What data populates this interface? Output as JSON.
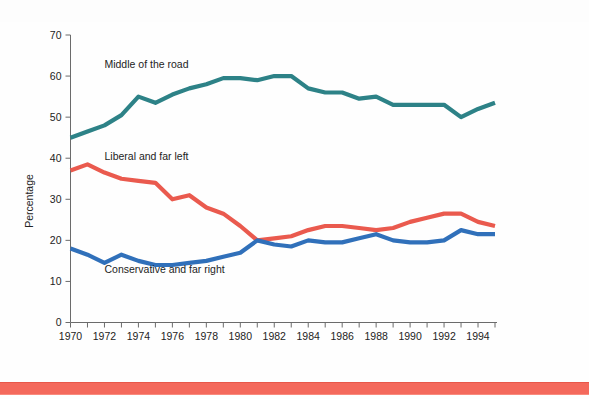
{
  "figure": {
    "background_color": "#fefefe",
    "footer_rule_color": "#f4695c"
  },
  "chart_data": {
    "type": "line",
    "title": "",
    "subtitle": "",
    "xlabel": "",
    "ylabel": "Percentage",
    "xlim": [
      1970,
      1995
    ],
    "ylim": [
      0,
      70
    ],
    "yticks": [
      0,
      10,
      20,
      30,
      40,
      50,
      60,
      70
    ],
    "ytick_labels": [
      "0",
      "10",
      "20",
      "30",
      "40",
      "50",
      "60",
      "70"
    ],
    "xticks": [
      1970,
      1971,
      1972,
      1973,
      1974,
      1975,
      1976,
      1977,
      1978,
      1979,
      1980,
      1981,
      1982,
      1983,
      1984,
      1985,
      1986,
      1987,
      1988,
      1989,
      1990,
      1991,
      1992,
      1993,
      1994,
      1995
    ],
    "xtick_labels_shown": [
      "1970",
      "1972",
      "1974",
      "1976",
      "1978",
      "1980",
      "1982",
      "1984",
      "1986",
      "1988",
      "1990",
      "1992",
      "1994"
    ],
    "grid": false,
    "legend_position": "inline-annotations",
    "x": [
      1970,
      1971,
      1972,
      1973,
      1974,
      1975,
      1976,
      1977,
      1978,
      1979,
      1980,
      1981,
      1982,
      1983,
      1984,
      1985,
      1986,
      1987,
      1988,
      1989,
      1990,
      1991,
      1992,
      1993,
      1994,
      1995
    ],
    "series": [
      {
        "name": "Middle of the road",
        "color": "#2d8287",
        "label_text": "Middle of the road",
        "values": [
          45.0,
          46.5,
          48.0,
          50.5,
          55.0,
          53.5,
          55.5,
          57.0,
          58.0,
          59.5,
          59.5,
          59.0,
          60.0,
          60.0,
          57.0,
          56.0,
          56.0,
          54.5,
          55.0,
          53.0,
          53.0,
          53.0,
          53.0,
          50.0,
          52.0,
          53.5
        ]
      },
      {
        "name": "Liberal and far left",
        "color": "#ea5a4e",
        "label_text": "Liberal and far left",
        "values": [
          37.0,
          38.5,
          36.5,
          35.0,
          34.5,
          34.0,
          30.0,
          31.0,
          28.0,
          26.5,
          23.5,
          20.0,
          20.5,
          21.0,
          22.5,
          23.5,
          23.5,
          23.0,
          22.5,
          23.0,
          24.5,
          25.5,
          26.5,
          26.5,
          24.5,
          23.5
        ]
      },
      {
        "name": "Conservative and far right",
        "color": "#3070ba",
        "label_text": "Conservative and far right",
        "values": [
          18.0,
          16.5,
          14.5,
          16.5,
          15.0,
          14.0,
          14.0,
          14.5,
          15.0,
          16.0,
          17.0,
          20.0,
          19.0,
          18.5,
          20.0,
          19.5,
          19.5,
          20.5,
          21.5,
          20.0,
          19.5,
          19.5,
          20.0,
          22.5,
          21.5,
          21.5
        ]
      }
    ],
    "annotations": [
      {
        "text": "Middle of the road",
        "x": 1972.0,
        "y": 62.0
      },
      {
        "text": "Liberal and far left",
        "x": 1972.0,
        "y": 39.5
      },
      {
        "text": "Conservative and far right",
        "x": 1972.0,
        "y": 12.0
      }
    ]
  }
}
